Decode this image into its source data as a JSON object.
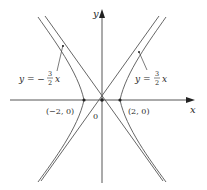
{
  "figure": {
    "axes": {
      "x_label": "x",
      "y_label": "y",
      "origin_label": "0"
    },
    "points": [
      {
        "label": "(−2, 0)",
        "x": -2,
        "y": 0
      },
      {
        "label": "(2, 0)",
        "x": 2,
        "y": 0
      }
    ],
    "asymptotes": [
      {
        "label_prefix": "y = −",
        "num": "3",
        "den": "2",
        "var": "x",
        "slope": -1.5
      },
      {
        "label_prefix": "y = ",
        "num": "3",
        "den": "2",
        "var": "x",
        "slope": 1.5
      }
    ],
    "colors": {
      "curve": "#555555",
      "axis": "#444444",
      "text": "#2a2a2a"
    }
  }
}
